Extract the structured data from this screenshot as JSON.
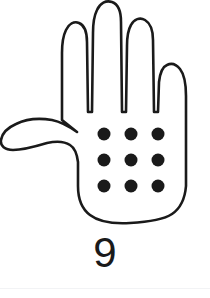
{
  "card": {
    "title": "Hand counting card",
    "numeral": "9",
    "background_color": "#ffffff",
    "outline_color": "#1a1a1a",
    "dot_color": "#1a1a1a",
    "rule_color": "#f2f3f5"
  },
  "hand": {
    "name": "open-hand-outline",
    "fingers_extended": 4,
    "thumb_extended": true,
    "orientation": "palm-facing-fingers-up-thumb-left"
  },
  "dots": {
    "total": 9,
    "rows": 3,
    "columns": 3,
    "radius": 6.5,
    "positions": [
      {
        "cx": 104,
        "cy": 134
      },
      {
        "cx": 131,
        "cy": 134
      },
      {
        "cx": 158,
        "cy": 134
      },
      {
        "cx": 104,
        "cy": 160
      },
      {
        "cx": 131,
        "cy": 160
      },
      {
        "cx": 158,
        "cy": 160
      },
      {
        "cx": 104,
        "cy": 186
      },
      {
        "cx": 131,
        "cy": 186
      },
      {
        "cx": 158,
        "cy": 186
      }
    ]
  }
}
